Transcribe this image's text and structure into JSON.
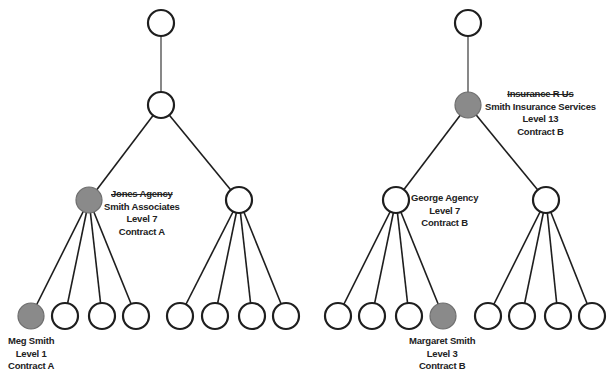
{
  "colors": {
    "node_stroke": "#1e1e1e",
    "highlight_fill": "#8a8a8a",
    "empty_fill": "#ffffff",
    "text": "#222222"
  },
  "trees": [
    {
      "id": "left",
      "root": {
        "x": 161,
        "y": 23,
        "filled": false
      },
      "level2": {
        "x": 161,
        "y": 105,
        "filled": false
      },
      "children": [
        {
          "x": 89,
          "y": 200,
          "filled": true,
          "label": {
            "struck_name": "Jones Agency",
            "name": "Smith Associates",
            "level": "Level 7",
            "contract": "Contract A"
          },
          "leaves": [
            {
              "x": 31,
              "y": 316,
              "filled": true,
              "label": {
                "name": "Meg Smith",
                "level": "Level 1",
                "contract": "Contract A"
              }
            },
            {
              "x": 65,
              "y": 316,
              "filled": false
            },
            {
              "x": 102,
              "y": 316,
              "filled": false
            },
            {
              "x": 136,
              "y": 316,
              "filled": false
            }
          ]
        },
        {
          "x": 239,
          "y": 200,
          "filled": false,
          "leaves": [
            {
              "x": 180,
              "y": 316,
              "filled": false
            },
            {
              "x": 215,
              "y": 316,
              "filled": false
            },
            {
              "x": 252,
              "y": 316,
              "filled": false
            },
            {
              "x": 286,
              "y": 316,
              "filled": false
            }
          ]
        }
      ]
    },
    {
      "id": "right",
      "root": {
        "x": 468,
        "y": 23,
        "filled": false
      },
      "level2": {
        "x": 468,
        "y": 105,
        "filled": true,
        "label": {
          "struck_name": "Insurance R Us",
          "name": "Smith Insurance Services",
          "level": "Level 13",
          "contract": "Contract B"
        }
      },
      "children": [
        {
          "x": 396,
          "y": 200,
          "filled": false,
          "label": {
            "name": "George Agency",
            "level": "Level 7",
            "contract": "Contract B"
          },
          "leaves": [
            {
              "x": 338,
              "y": 316,
              "filled": false
            },
            {
              "x": 372,
              "y": 316,
              "filled": false
            },
            {
              "x": 409,
              "y": 316,
              "filled": false
            },
            {
              "x": 443,
              "y": 316,
              "filled": true,
              "label": {
                "name": "Margaret Smith",
                "level": "Level 3",
                "contract": "Contract B"
              }
            }
          ]
        },
        {
          "x": 546,
          "y": 200,
          "filled": false,
          "leaves": [
            {
              "x": 488,
              "y": 316,
              "filled": false
            },
            {
              "x": 522,
              "y": 316,
              "filled": false
            },
            {
              "x": 558,
              "y": 316,
              "filled": false
            },
            {
              "x": 592,
              "y": 316,
              "filled": false
            }
          ]
        }
      ]
    }
  ]
}
